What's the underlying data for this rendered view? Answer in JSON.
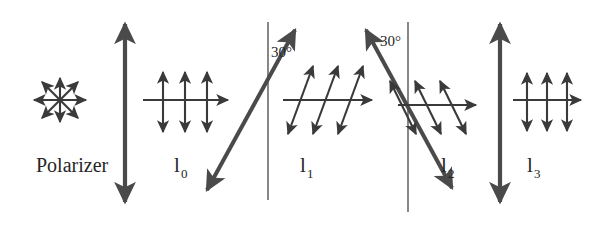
{
  "figure": {
    "background_color": "#ffffff",
    "stroke_color": "#3a3a3a",
    "thick_stroke_color": "#4a4a4a",
    "text_color": "#262626"
  },
  "labels": {
    "polarizer": "Polarizer",
    "intensity_0": "l",
    "intensity_0_sub": "0",
    "intensity_1": "l",
    "intensity_1_sub": "1",
    "intensity_2": "l",
    "intensity_2_sub": "2",
    "intensity_3": "l",
    "intensity_3_sub": "3",
    "angle_1": "30°",
    "angle_2": "30°"
  },
  "elements": {
    "unpolarized_source": {
      "name": "unpolarized-light-star",
      "description": "eight-ray double-headed arrow star representing unpolarized light",
      "ray_count": 8
    },
    "polarizer_1": {
      "name": "polarizer-1-vertical-axis",
      "orientation": "vertical",
      "angle_from_vertical_deg": 0
    },
    "polarizer_2": {
      "name": "polarizer-2-tilted-axis",
      "orientation": "tilted-right",
      "angle_from_vertical_deg": 30
    },
    "polarizer_3": {
      "name": "polarizer-3-tilted-axis",
      "orientation": "tilted-left",
      "angle_from_vertical_deg": 30
    },
    "polarizer_4": {
      "name": "polarizer-4-vertical-axis",
      "orientation": "vertical",
      "angle_from_vertical_deg": 0
    },
    "beam_0": {
      "name": "beam-I0",
      "polarization": "vertical",
      "arrow_count": 3
    },
    "beam_1": {
      "name": "beam-I1",
      "polarization": "tilted-right-30-from-vertical",
      "arrow_count": 3
    },
    "beam_2": {
      "name": "beam-I2",
      "polarization": "tilted-left-30-from-vertical",
      "arrow_count": 3
    },
    "beam_3": {
      "name": "beam-I3",
      "polarization": "vertical",
      "arrow_count": 3
    }
  }
}
